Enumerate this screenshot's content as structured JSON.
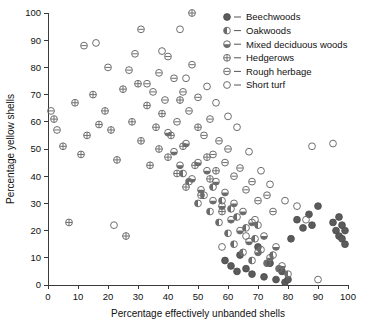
{
  "chart_data": {
    "type": "scatter",
    "title": "",
    "xlabel": "Percentage effectively unbanded shells",
    "ylabel": "Percentage yellow shells",
    "xlim": [
      0,
      100
    ],
    "ylim": [
      0,
      100
    ],
    "xticks": [
      0,
      10,
      20,
      30,
      40,
      50,
      60,
      70,
      80,
      90,
      100
    ],
    "yticks": [
      0,
      10,
      20,
      30,
      40,
      50,
      60,
      70,
      80,
      90,
      100
    ],
    "grid": false,
    "legend_position": "top-right",
    "series": [
      {
        "name": "Beechwoods",
        "marker": "filled-circle",
        "points": [
          [
            59,
            9
          ],
          [
            61,
            7
          ],
          [
            63,
            5
          ],
          [
            64,
            11
          ],
          [
            66,
            6
          ],
          [
            68,
            4
          ],
          [
            70,
            14
          ],
          [
            72,
            3
          ],
          [
            74,
            8
          ],
          [
            76,
            2
          ],
          [
            78,
            5
          ],
          [
            79,
            1
          ],
          [
            80,
            2
          ],
          [
            81,
            17
          ],
          [
            83,
            24
          ],
          [
            85,
            21
          ],
          [
            87,
            26
          ],
          [
            88,
            22
          ],
          [
            90,
            29
          ],
          [
            95,
            23
          ],
          [
            96,
            20
          ],
          [
            97,
            25
          ],
          [
            97,
            18
          ],
          [
            98,
            22
          ],
          [
            98,
            17
          ],
          [
            99,
            20
          ],
          [
            99,
            15
          ]
        ]
      },
      {
        "name": "Oakwoods",
        "marker": "half-left-circle",
        "points": [
          [
            45,
            41
          ],
          [
            47,
            38
          ],
          [
            50,
            30
          ],
          [
            52,
            33
          ],
          [
            54,
            27
          ],
          [
            55,
            36
          ],
          [
            57,
            23
          ],
          [
            58,
            31
          ],
          [
            60,
            19
          ],
          [
            61,
            28
          ],
          [
            62,
            15
          ],
          [
            63,
            25
          ],
          [
            65,
            12
          ],
          [
            66,
            21
          ],
          [
            68,
            9
          ],
          [
            69,
            17
          ],
          [
            70,
            22
          ],
          [
            71,
            13
          ],
          [
            73,
            8
          ],
          [
            75,
            11
          ],
          [
            77,
            6
          ],
          [
            80,
            4
          ]
        ]
      },
      {
        "name": "Mixed deciduous woods",
        "marker": "bottom-half-circle",
        "points": [
          [
            40,
            56
          ],
          [
            42,
            49
          ],
          [
            44,
            44
          ],
          [
            46,
            52
          ],
          [
            48,
            39
          ],
          [
            50,
            45
          ],
          [
            51,
            35
          ],
          [
            53,
            42
          ],
          [
            55,
            31
          ],
          [
            56,
            38
          ],
          [
            58,
            29
          ],
          [
            59,
            34
          ],
          [
            61,
            24
          ],
          [
            62,
            30
          ],
          [
            64,
            20
          ],
          [
            65,
            27
          ],
          [
            67,
            16
          ],
          [
            68,
            23
          ],
          [
            70,
            12
          ],
          [
            72,
            18
          ],
          [
            74,
            10
          ],
          [
            76,
            14
          ],
          [
            78,
            7
          ]
        ]
      },
      {
        "name": "Hedgerows",
        "marker": "crossed-circle",
        "points": [
          [
            2,
            61
          ],
          [
            5,
            51
          ],
          [
            7,
            23
          ],
          [
            9,
            67
          ],
          [
            11,
            48
          ],
          [
            13,
            55
          ],
          [
            15,
            70
          ],
          [
            17,
            59
          ],
          [
            19,
            64
          ],
          [
            21,
            57
          ],
          [
            23,
            46
          ],
          [
            25,
            72
          ],
          [
            26,
            18
          ],
          [
            28,
            60
          ],
          [
            30,
            74
          ],
          [
            31,
            53
          ],
          [
            33,
            66
          ],
          [
            34,
            44
          ],
          [
            36,
            58
          ],
          [
            37,
            50
          ],
          [
            38,
            63
          ],
          [
            40,
            47
          ],
          [
            41,
            55
          ],
          [
            43,
            41
          ],
          [
            44,
            68
          ],
          [
            45,
            51
          ],
          [
            46,
            36
          ],
          [
            48,
            100
          ],
          [
            49,
            44
          ],
          [
            50,
            58
          ],
          [
            51,
            33
          ],
          [
            53,
            47
          ],
          [
            54,
            39
          ],
          [
            56,
            42
          ],
          [
            58,
            27
          ]
        ]
      },
      {
        "name": "Rough herbage",
        "marker": "dashed-circle",
        "points": [
          [
            1,
            64
          ],
          [
            3,
            57
          ],
          [
            12,
            88
          ],
          [
            20,
            80
          ],
          [
            27,
            79
          ],
          [
            29,
            85
          ],
          [
            31,
            94
          ],
          [
            33,
            74
          ],
          [
            35,
            71
          ],
          [
            37,
            78
          ],
          [
            39,
            68
          ],
          [
            40,
            84
          ],
          [
            42,
            76
          ],
          [
            43,
            60
          ],
          [
            45,
            71
          ],
          [
            47,
            64
          ],
          [
            48,
            81
          ],
          [
            50,
            69
          ],
          [
            52,
            55
          ],
          [
            54,
            61
          ],
          [
            55,
            48
          ],
          [
            57,
            53
          ],
          [
            59,
            45
          ],
          [
            60,
            50
          ],
          [
            62,
            40
          ],
          [
            64,
            43
          ],
          [
            66,
            35
          ],
          [
            68,
            38
          ],
          [
            70,
            31
          ],
          [
            73,
            33
          ],
          [
            75,
            27
          ]
        ]
      },
      {
        "name": "Short turf",
        "marker": "open-circle",
        "points": [
          [
            16,
            89
          ],
          [
            22,
            22
          ],
          [
            38,
            86
          ],
          [
            44,
            94
          ],
          [
            46,
            76
          ],
          [
            53,
            73
          ],
          [
            56,
            67
          ],
          [
            60,
            62
          ],
          [
            63,
            58
          ],
          [
            67,
            49
          ],
          [
            71,
            42
          ],
          [
            74,
            37
          ],
          [
            79,
            31
          ],
          [
            83,
            29
          ],
          [
            86,
            24
          ],
          [
            88,
            51
          ],
          [
            95,
            52
          ],
          [
            90,
            2
          ],
          [
            66,
            18
          ],
          [
            69,
            24
          ],
          [
            58,
            14
          ]
        ]
      }
    ],
    "legend": [
      "Beechwoods",
      "Oakwoods",
      "Mixed deciduous woods",
      "Hedgerows",
      "Rough herbage",
      "Short turf"
    ]
  },
  "colors": {
    "axis": "#3a3a3a",
    "marker_stroke": "#6e6e6e",
    "marker_fill": "#5b5b5b",
    "text": "#111111",
    "background": "#ffffff"
  }
}
